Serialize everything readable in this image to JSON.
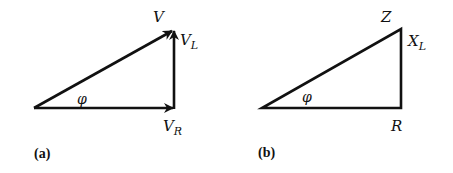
{
  "diagram_a": {
    "caption": "(a)",
    "labels": {
      "hypotenuse": "V",
      "vertical_main": "V",
      "vertical_sub": "L",
      "horizontal_main": "V",
      "horizontal_sub": "R",
      "angle": "φ"
    },
    "description": "Voltage phasor triangle: V_R horizontal, V_L vertical, V hypotenuse, arrows on all sides"
  },
  "diagram_b": {
    "caption": "(b)",
    "labels": {
      "hypotenuse": "Z",
      "vertical_main": "X",
      "vertical_sub": "L",
      "horizontal": "R",
      "angle": "φ"
    },
    "description": "Impedance triangle: R horizontal, X_L vertical, Z hypotenuse"
  },
  "colors": {
    "stroke": "#111111",
    "background": "#ffffff"
  }
}
